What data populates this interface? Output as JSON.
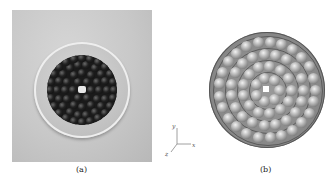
{
  "figure": {
    "panel_a": {
      "caption": "(a)",
      "description": "Photograph of black spheres packed in a transparent circular dish"
    },
    "panel_b": {
      "caption": "(b)",
      "description": "Rendered 3D model of concentric rings of spheres in a circular container"
    },
    "axes": {
      "x_label": "x",
      "y_label": "y",
      "z_label": "z"
    }
  }
}
